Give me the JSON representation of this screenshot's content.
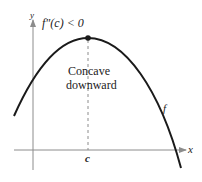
{
  "figure": {
    "title_condition": "f″(c) < 0",
    "annotation_line1": "Concave",
    "annotation_line2": "downward",
    "function_label": "f",
    "point_label": "c",
    "x_axis_label": "x",
    "y_axis_label": "y",
    "colors": {
      "curve": "#1a1a1a",
      "axes": "#8c8c8c",
      "dashed": "#8c8c8c",
      "text": "#222222"
    }
  }
}
